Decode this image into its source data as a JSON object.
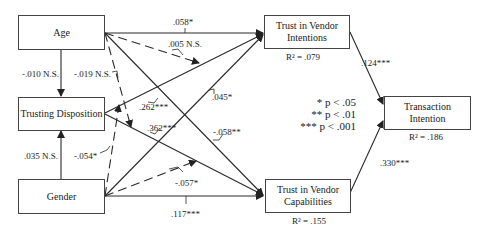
{
  "nodes": {
    "age": {
      "label": "Age"
    },
    "trusting_disposition": {
      "label": "Trusting Disposition"
    },
    "gender": {
      "label": "Gender"
    },
    "tvi": {
      "label": "Trust in Vendor Intentions",
      "r2": "R² = .079"
    },
    "tvc": {
      "label": "Trust in Vendor Capabilities",
      "r2": "R² = .155"
    },
    "ti": {
      "label": "Transaction Intention",
      "r2": "R² = .186"
    }
  },
  "paths": {
    "age_tvi": ".058*",
    "age_mod_td_tvi": ".005 N.S.",
    "age_td": "-.010 N.S.",
    "age_mod_td_tvc": "-.019 N.S.",
    "td_tvi": ".262***",
    "td_tvc": ".362***",
    "gender_tvi": ".045*",
    "age_tvc": "-.058**",
    "gender_td": ".035 N.S.",
    "gender_mod_td_tvi": "-.054*",
    "gender_mod_td_tvc": "-.057*",
    "gender_tvc": ".117***",
    "tvi_ti": ".124***",
    "tvc_ti": ".330***"
  },
  "legend": {
    "l1": "* p < .05",
    "l2": "** p < .01",
    "l3": "*** p < .001"
  },
  "colors": {
    "line": "#2a2a2a",
    "box_border": "#444444"
  }
}
